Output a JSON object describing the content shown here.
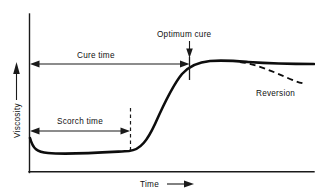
{
  "figure": {
    "background_color": "#ffffff",
    "line_color": "#0d0d0d"
  },
  "axes": {
    "y_label": "Viscosity",
    "y_arrow_icon": "up-arrow-icon",
    "x_label": "Time",
    "x_arrow_icon": "right-arrow-icon",
    "x_axis_start_x": 29,
    "x_axis_end_x": 314,
    "x_axis_y": 172,
    "y_axis_top_y": 14,
    "y_axis_x": 29
  },
  "annotations": {
    "cure_time": {
      "label": "Cure time",
      "start_x": 30,
      "end_x": 189,
      "y": 64,
      "style": "double-headed-arrow"
    },
    "scorch_time": {
      "label": "Scorch time",
      "start_x": 30,
      "end_x": 130,
      "y": 131,
      "style": "double-headed-arrow"
    },
    "scorch_marker": {
      "label": "scorch-dashed-marker",
      "x": 130,
      "top_y": 108,
      "bottom_y": 153,
      "style": "dashed-vertical"
    },
    "optimum_cure": {
      "label": "Optimum cure",
      "text_x": 196,
      "text_y": 36,
      "arrow_x": 189,
      "arrow_top_y": 40,
      "arrow_bottom_y": 57,
      "tick_top_y": 55,
      "tick_bottom_y": 80,
      "style": "down-arrow-with-tick"
    },
    "reversion": {
      "label": "Reversion",
      "text_x": 258,
      "text_y": 93,
      "branch_start_x": 240,
      "branch_start_y": 63,
      "branch_end_x": 305,
      "branch_end_y": 84,
      "style": "dashed-branch"
    }
  },
  "chart_data": {
    "type": "line",
    "title": "",
    "xlabel": "Time",
    "ylabel": "Viscosity",
    "grid": false,
    "legend": null,
    "axis_ticks": {
      "x": [],
      "y": []
    },
    "series": [
      {
        "name": "Cure curve",
        "style": "solid",
        "path": "M 30,138 C 33,149 37,152 48,153 C 70,155 110,152 129,151 C 141,150 148,139 155,124 C 163,106 172,86 182,74 C 190,65 199,62 210,61 C 225,60 236,61 248,62 C 268,63.4 290,64 314,64",
        "description": "Viscosity dips from the initial value, stays flat during the scorch (induction) period, rises steeply through the cure phase, then levels off at the plateau (optimum cure)."
      },
      {
        "name": "Reversion",
        "style": "dashed",
        "path": "M 240,62 C 255,64 272,71 290,79 C 296,81.5 301,83 306,84",
        "description": "Dashed branch showing loss of viscosity after the optimum cure point (over-cure reversion)."
      }
    ],
    "annotations": [
      {
        "text": "Cure time",
        "kind": "span",
        "from": "t=0",
        "to": "optimum cure"
      },
      {
        "text": "Scorch time",
        "kind": "span",
        "from": "t=0",
        "to": "onset of cure"
      },
      {
        "text": "Optimum cure",
        "kind": "point",
        "at": "end of cure rise"
      },
      {
        "text": "Reversion",
        "kind": "branch",
        "at": "after plateau"
      }
    ]
  }
}
